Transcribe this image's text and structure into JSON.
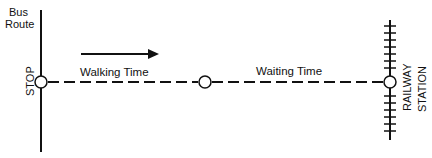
{
  "diagram": {
    "labels": {
      "bus_route_line1": "Bus",
      "bus_route_line2": "Route",
      "stop": "STOP",
      "walking_time": "Walking Time",
      "waiting_time": "Waiting Time",
      "railway": "RAILWAY",
      "station": "STATION"
    },
    "colors": {
      "ink": "#111111",
      "background": "#ffffff"
    }
  }
}
